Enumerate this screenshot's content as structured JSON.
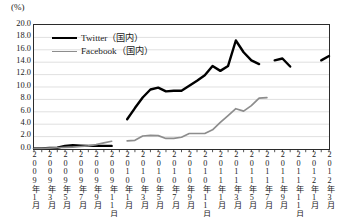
{
  "unit_label": "(%)",
  "legend": {
    "position": "top-left-inside",
    "items": [
      {
        "name": "twitter-series",
        "label": "Twitter（国内）",
        "color": "#000000",
        "style": "thick"
      },
      {
        "name": "facebook-series",
        "label": "Facebook（国内）",
        "color": "#8d8d8d",
        "style": "thin"
      }
    ]
  },
  "chart_data": {
    "type": "line",
    "title": "",
    "subtitle": "",
    "xlabel": "",
    "ylabel": "(%)",
    "ylim": [
      0.0,
      20.0
    ],
    "ytick_labels": [
      "20.0",
      "18.0",
      "16.0",
      "14.0",
      "12.0",
      "10.0",
      "8.0",
      "6.0",
      "4.0",
      "2.0",
      "0.0"
    ],
    "ytick_values": [
      20.0,
      18.0,
      16.0,
      14.0,
      12.0,
      10.0,
      8.0,
      6.0,
      4.0,
      2.0,
      0.0
    ],
    "grid": true,
    "grid_axis": "y",
    "legend_position": "top-left",
    "x_tick_interval_months": 1,
    "x_label_interval_months": 2,
    "x": [
      "2009年1月",
      "2009年2月",
      "2009年3月",
      "2009年4月",
      "2009年5月",
      "2009年6月",
      "2009年7月",
      "2009年8月",
      "2009年9月",
      "2009年10月",
      "2009年11月",
      "2009年12月",
      "2010年1月",
      "2010年2月",
      "2010年3月",
      "2010年4月",
      "2010年5月",
      "2010年6月",
      "2010年7月",
      "2010年8月",
      "2010年9月",
      "2010年10月",
      "2010年11月",
      "2010年12月",
      "2011年1月",
      "2011年2月",
      "2011年3月",
      "2011年4月",
      "2011年5月",
      "2011年6月",
      "2011年7月",
      "2011年8月",
      "2011年9月",
      "2011年10月",
      "2011年11月",
      "2011年12月",
      "2012年1月",
      "2012年2月",
      "2012年3月"
    ],
    "xtick_labels": [
      "2009年1月",
      "2009年3月",
      "2009年5月",
      "2009年7月",
      "2009年9月",
      "2009年11月",
      "2010年1月",
      "2010年3月",
      "2010年5月",
      "2010年7月",
      "2010年9月",
      "2010年11月",
      "2011年1月",
      "2011年3月",
      "2011年5月",
      "2011年7月",
      "2011年9月",
      "2011年11月",
      "2012年1月",
      "2012年3月"
    ],
    "series": [
      {
        "name": "Twitter（国内）",
        "color": "#000000",
        "width": 2.4,
        "values": [
          0.1,
          0.1,
          0.15,
          0.2,
          0.5,
          0.6,
          0.55,
          0.5,
          0.5,
          0.5,
          0.5,
          null,
          4.8,
          6.6,
          8.3,
          9.6,
          9.9,
          9.3,
          9.4,
          9.4,
          10.2,
          11.0,
          11.9,
          13.4,
          12.6,
          13.4,
          17.5,
          15.6,
          14.3,
          13.7,
          null,
          14.3,
          14.6,
          13.3,
          null,
          null,
          null,
          14.3,
          15.0
        ]
      },
      {
        "name": "Facebook（国内）",
        "color": "#8d8d8d",
        "width": 1.7,
        "values": [
          0.1,
          0.1,
          0.15,
          0.2,
          0.25,
          0.3,
          0.4,
          0.5,
          0.7,
          1.0,
          1.25,
          null,
          1.3,
          1.4,
          2.1,
          2.2,
          2.15,
          1.7,
          1.7,
          1.9,
          2.5,
          2.5,
          2.5,
          3.1,
          4.3,
          5.4,
          6.5,
          6.1,
          7.0,
          8.2,
          8.3,
          null,
          null,
          8.5,
          null,
          null,
          null,
          null,
          null
        ]
      }
    ]
  }
}
